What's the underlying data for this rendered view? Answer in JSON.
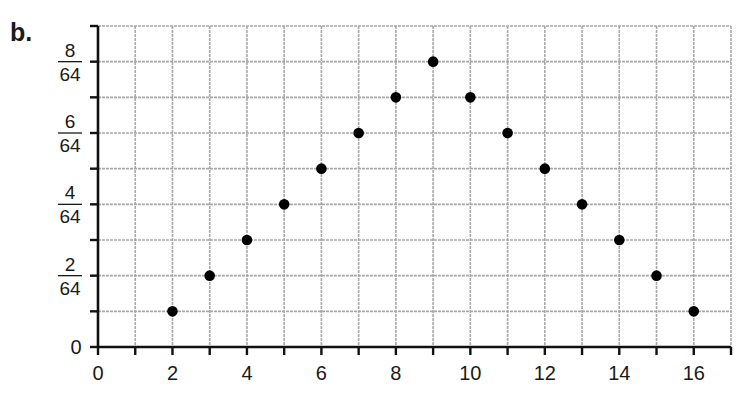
{
  "part_label": "b.",
  "chart_data": {
    "type": "scatter",
    "title": "",
    "xlabel": "",
    "ylabel": "",
    "x": [
      2,
      3,
      4,
      5,
      6,
      7,
      8,
      9,
      10,
      11,
      12,
      13,
      14,
      15,
      16
    ],
    "y": [
      1,
      2,
      3,
      4,
      5,
      6,
      7,
      8,
      7,
      6,
      5,
      4,
      3,
      2,
      1
    ],
    "y_unit_denominator": 64,
    "y_values_as_fractions": [
      "1/64",
      "2/64",
      "3/64",
      "4/64",
      "5/64",
      "6/64",
      "7/64",
      "8/64",
      "7/64",
      "6/64",
      "5/64",
      "4/64",
      "3/64",
      "2/64",
      "1/64"
    ],
    "xlim": [
      0,
      17
    ],
    "ylim": [
      0,
      9
    ],
    "x_ticks": [
      0,
      1,
      2,
      3,
      4,
      5,
      6,
      7,
      8,
      9,
      10,
      11,
      12,
      13,
      14,
      15,
      16,
      17
    ],
    "x_tick_labels": [
      {
        "value": 0,
        "label": "0"
      },
      {
        "value": 2,
        "label": "2"
      },
      {
        "value": 4,
        "label": "4"
      },
      {
        "value": 6,
        "label": "6"
      },
      {
        "value": 8,
        "label": "8"
      },
      {
        "value": 10,
        "label": "10"
      },
      {
        "value": 12,
        "label": "12"
      },
      {
        "value": 14,
        "label": "14"
      },
      {
        "value": 16,
        "label": "16"
      }
    ],
    "y_ticks": [
      0,
      1,
      2,
      3,
      4,
      5,
      6,
      7,
      8,
      9
    ],
    "y_tick_labels": [
      {
        "value": 0,
        "label": "0"
      },
      {
        "value": 2,
        "numerator": "2",
        "denominator": "64"
      },
      {
        "value": 4,
        "numerator": "4",
        "denominator": "64"
      },
      {
        "value": 6,
        "numerator": "6",
        "denominator": "64"
      },
      {
        "value": 8,
        "numerator": "8",
        "denominator": "64"
      }
    ],
    "grid": true,
    "legend": null,
    "colors": {
      "points": "#000000",
      "axis": "#111111",
      "grid": "#a8a8a8",
      "text": "#1a1a1a"
    }
  }
}
